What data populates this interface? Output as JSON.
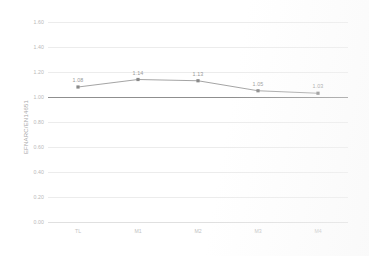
{
  "chart_data": {
    "type": "line",
    "title": "",
    "xlabel": "",
    "ylabel": "EFNARC/EN14651",
    "categories": [
      "TL",
      "M1",
      "M2",
      "M3",
      "M4"
    ],
    "values": [
      1.08,
      1.14,
      1.13,
      1.05,
      1.03
    ],
    "point_labels": [
      "1.08",
      "1.14",
      "1.13",
      "1.05",
      "1.03"
    ],
    "ylim": [
      0.0,
      1.6
    ],
    "ytick_labels": [
      "1.60",
      "1.40",
      "1.20",
      "1.00",
      "0.80",
      "0.60",
      "0.40",
      "0.20",
      "0.00"
    ],
    "ytick_values": [
      1.6,
      1.4,
      1.2,
      1.0,
      0.8,
      0.6,
      0.4,
      0.2,
      0.0
    ],
    "reference_line": 1.0,
    "grid": true,
    "legend": "none",
    "series": [
      {
        "name": "EFNARC/EN14651",
        "values": [
          1.08,
          1.14,
          1.13,
          1.05,
          1.03
        ]
      }
    ],
    "colors": {
      "series_line": "#9a9a9a",
      "marker": "#8a8a8a",
      "grid": "#ececec",
      "reference_line": "#8f8f8f",
      "tick_text": "#bdbdbd",
      "axis_title": "#a8a8a8",
      "background": "#ffffff"
    }
  }
}
